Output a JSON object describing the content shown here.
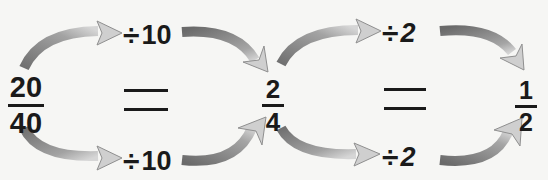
{
  "diagram": {
    "title": "",
    "fractions": [
      {
        "numerator": "20",
        "denominator": "40"
      },
      {
        "numerator": "2",
        "denominator": "4"
      },
      {
        "numerator": "1",
        "denominator": "2"
      }
    ],
    "equals": [
      "=",
      "="
    ],
    "operations": [
      {
        "position": "top",
        "symbol": "÷",
        "value": "10"
      },
      {
        "position": "bottom",
        "symbol": "÷",
        "value": "10"
      },
      {
        "position": "top",
        "symbol": "÷",
        "value": "2"
      },
      {
        "position": "bottom",
        "symbol": "÷",
        "value": "2"
      }
    ],
    "colors": {
      "background": "#f6f6f4",
      "text": "#1a1a1a",
      "arrow_dark": "#777777",
      "arrow_light": "#cfcfcf",
      "arrow_outline": "#8a8a8a"
    }
  }
}
